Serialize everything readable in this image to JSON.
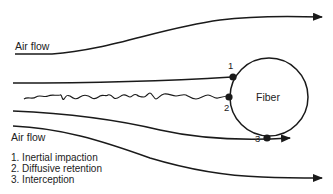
{
  "diagram": {
    "labels": {
      "airflow_top": "Air flow",
      "airflow_bottom": "Air flow",
      "fiber": "Fiber",
      "marker_1": "1",
      "marker_2": "2",
      "marker_3": "3"
    },
    "legend": [
      {
        "label": "1. Inertial impaction"
      },
      {
        "label": "2. Diffusive retention"
      },
      {
        "label": "3. Interception"
      }
    ],
    "colors": {
      "stroke": "#1a1a1a",
      "text": "#222222",
      "background": "#ffffff"
    }
  }
}
